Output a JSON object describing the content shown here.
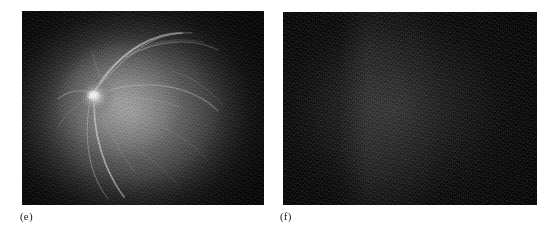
{
  "figure": {
    "background_color": "#ffffff",
    "width": 550,
    "height": 235,
    "panel_count": 2,
    "modality": "fluorescein angiography",
    "panels": [
      {
        "id": "e",
        "caption": "(e)",
        "frame": {
          "x": 22,
          "y": 11,
          "width": 242,
          "height": 194
        },
        "description": "retinal fundus fluorescein angiogram with bright optic disc and visible vessel arcades",
        "appearance": {
          "background_color": "#0a0a0a",
          "fundus_gray": "#969696",
          "optic_disc_color": "#ffffff",
          "vessel_color": "#e1e1e1",
          "grain": "heavy"
        },
        "features": [
          "bright optic disc (upper-left of centre)",
          "superior temporal vessel arcade",
          "inferior vessel descending toward lower-left",
          "dark vignetted corners"
        ]
      },
      {
        "id": "f",
        "caption": "(f)",
        "frame": {
          "x": 283,
          "y": 12,
          "width": 254,
          "height": 193
        },
        "description": "near-black fluorescein angiography frame, retinal detail not visible",
        "appearance": {
          "background_color": "#070707",
          "fundus_gray": "#2c2c2c",
          "optic_disc_color": "",
          "vessel_color": "",
          "grain": "heavy"
        },
        "features": [
          "uniformly very dark field",
          "faint slightly brighter vertical band left of centre",
          "diagonal sensor noise texture"
        ]
      }
    ]
  },
  "captions": {
    "panel_e_label": "(e)",
    "panel_f_label": "(f)"
  }
}
